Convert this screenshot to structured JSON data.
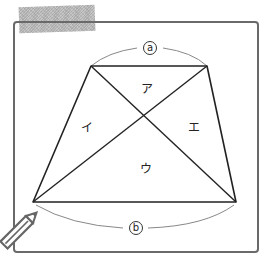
{
  "figure": {
    "type": "trapezoid-with-diagonals",
    "vertices": {
      "top_left": [
        91,
        66
      ],
      "top_right": [
        207,
        66
      ],
      "bottom_left": [
        33,
        202
      ],
      "bottom_right": [
        236,
        202
      ]
    },
    "colors": {
      "line": "#222222",
      "frame": "#6a6a6a",
      "arc": "#888888",
      "tape": "#bdbdbd",
      "pencil": "#666666"
    }
  },
  "labels": {
    "top_side": "a",
    "bottom_side": "b",
    "region_top": "ア",
    "region_left": "イ",
    "region_bottom": "ウ",
    "region_right": "エ"
  },
  "icons": {
    "pencil": "pencil-icon",
    "tape": "masking-tape"
  }
}
